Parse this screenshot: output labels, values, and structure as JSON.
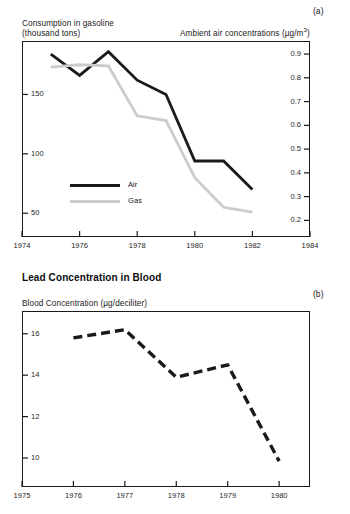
{
  "figure": {
    "panel_a": {
      "letter": "(a)",
      "left_axis_title_line1": "Consumption in gasoline",
      "left_axis_title_line2": "(thousand tons)",
      "right_axis_title_prefix": "Ambient air concentrations (µg/m",
      "right_axis_title_sup": "3",
      "right_axis_title_suffix": ")",
      "legend": [
        {
          "label": "Air",
          "color": "#1a1a1a",
          "style": "solid"
        },
        {
          "label": "Gas",
          "color": "#cccccc",
          "style": "solid"
        }
      ]
    },
    "panel_b": {
      "letter": "(b)",
      "title": "Lead Concentration in Blood",
      "axis_title": "Blood Concentration (µg/deciliter)"
    }
  },
  "chart_data": [
    {
      "id": "panel-a",
      "type": "line",
      "title": "",
      "panel_label": "(a)",
      "xlabel": "",
      "ylabel": "Consumption in gasoline (thousand tons)",
      "y2label": "Ambient air concentrations (µg/m3)",
      "xlim": [
        1974,
        1984
      ],
      "xticks": [
        1974,
        1976,
        1978,
        1980,
        1982,
        1984
      ],
      "xtick_labels": [
        "1974",
        "1976",
        "1978",
        "1980",
        "1982",
        "1984"
      ],
      "ylim": [
        30,
        195
      ],
      "yticks": [
        50,
        100,
        150
      ],
      "ytick_labels": [
        "50",
        "100",
        "150"
      ],
      "y2lim": [
        0.13,
        0.955
      ],
      "y2ticks": [
        0.2,
        0.3,
        0.4,
        0.5,
        0.6,
        0.7,
        0.8,
        0.9
      ],
      "y2tick_labels": [
        "0.2",
        "0.3",
        "0.4",
        "0.5",
        "0.6",
        "0.7",
        "0.8",
        "0.9"
      ],
      "grid": false,
      "legend_position": "inside-lower-left",
      "series": [
        {
          "name": "Air",
          "color": "#1a1a1a",
          "axis": "right",
          "units": "µg/m3",
          "x": [
            1975,
            1976,
            1977,
            1978,
            1979,
            1980,
            1981,
            1982
          ],
          "values": [
            0.9,
            0.81,
            0.91,
            0.79,
            0.73,
            0.45,
            0.45,
            0.33
          ]
        },
        {
          "name": "Gas",
          "color": "#cccccc",
          "axis": "left",
          "units": "thousand tons",
          "x": [
            1975,
            1976,
            1977,
            1978,
            1979,
            1980,
            1981,
            1982
          ],
          "values": [
            173,
            175,
            174,
            132,
            128,
            80,
            55,
            51
          ]
        }
      ]
    },
    {
      "id": "panel-b",
      "type": "line",
      "title": "Lead Concentration in Blood",
      "panel_label": "(b)",
      "xlabel": "",
      "ylabel": "Blood Concentration (µg/deciliter)",
      "xlim": [
        1975,
        1980.6
      ],
      "xticks": [
        1975,
        1976,
        1977,
        1978,
        1979,
        1980
      ],
      "xtick_labels": [
        "1975",
        "1976",
        "1977",
        "1978",
        "1979",
        "1980"
      ],
      "ylim": [
        8.6,
        17.1
      ],
      "yticks": [
        10,
        12,
        14,
        16
      ],
      "ytick_labels": [
        "10",
        "12",
        "14",
        "16"
      ],
      "grid": false,
      "legend_position": "none",
      "series": [
        {
          "name": "Blood lead concentration",
          "color": "#1a1a1a",
          "style": "dashed",
          "x": [
            1976,
            1977,
            1978,
            1979,
            1980
          ],
          "values": [
            15.8,
            16.2,
            13.9,
            14.5,
            9.85
          ]
        }
      ]
    }
  ]
}
